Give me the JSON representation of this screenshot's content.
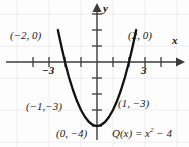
{
  "chart_data": {
    "type": "line",
    "title": "",
    "subtitle": "",
    "xlabel": "x",
    "ylabel": "y",
    "equation_text": "Q(x) = x",
    "equation_exponent": "2",
    "equation_tail": " − 4",
    "function": "Q(x) = x^2 - 4",
    "xlim": [
      -4.5,
      5.0
    ],
    "ylim": [
      -5.0,
      4.0
    ],
    "grid": true,
    "legend": "none",
    "x_tick_labels": [
      {
        "value": -3,
        "text": "−3"
      },
      {
        "value": 3,
        "text": "3"
      }
    ],
    "y_tick_labels": [],
    "annotations": [
      {
        "id": "x-intercept-left",
        "point": [
          -2,
          0
        ],
        "text": "(−2, 0)"
      },
      {
        "id": "x-intercept-right",
        "point": [
          2,
          0
        ],
        "text": "(2, 0)"
      },
      {
        "id": "point-left",
        "point": [
          -1,
          -3
        ],
        "text": "(−1,−3)"
      },
      {
        "id": "point-right",
        "point": [
          1,
          -3
        ],
        "text": "(1, −3)"
      },
      {
        "id": "vertex",
        "point": [
          0,
          -4
        ],
        "text": "(0, −4)"
      }
    ],
    "series": [
      {
        "name": "Q(x) = x^2 - 4",
        "color": "#111111",
        "x": [
          -2.45,
          -2.2,
          -2.0,
          -1.75,
          -1.5,
          -1.25,
          -1.0,
          -0.75,
          -0.5,
          -0.25,
          0,
          0.25,
          0.5,
          0.75,
          1.0,
          1.25,
          1.5,
          1.75,
          2.0,
          2.2,
          2.45
        ],
        "values": [
          2.0,
          0.84,
          0.0,
          -0.94,
          -1.75,
          -2.44,
          -3.0,
          -3.44,
          -3.75,
          -3.94,
          -4.0,
          -3.94,
          -3.75,
          -3.44,
          -3.0,
          -2.44,
          -1.75,
          -0.94,
          0.0,
          0.84,
          2.0
        ]
      }
    ]
  },
  "colors": {
    "curve": "#111111",
    "axis": "#3b3b3b",
    "grid": "#ededed",
    "background": "#fdfdfd",
    "text": "#1a1a1a"
  },
  "labels": {
    "x_axis_name": "x",
    "y_axis_name": "y",
    "tick_neg3": "−3",
    "tick_3": "3",
    "point_neg2_0": "(−2, 0)",
    "point_2_0": "(2, 0)",
    "point_neg1_neg3": "(−1,−3)",
    "point_1_neg3": "(1, −3)",
    "point_0_neg4": "(0, −4)",
    "equation_head": "Q(x) = x",
    "equation_exp": "2",
    "equation_tail": " − 4"
  }
}
